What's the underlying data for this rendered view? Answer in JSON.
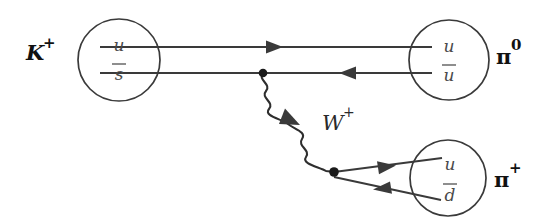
{
  "figure": {
    "type": "feynman-diagram",
    "background_color": "#ffffff",
    "line_color": "#3a3a3a",
    "label_color": "#111111",
    "quark_label_color": "#4a4a4a"
  },
  "initial_state": {
    "name": "kaon-plus",
    "symbol": "K",
    "charge": "+",
    "quarks": [
      {
        "symbol": "u",
        "bar": false
      },
      {
        "symbol": "s",
        "bar": true
      }
    ],
    "blob": {
      "cx": 119,
      "cy": 60,
      "r": 41
    },
    "label_position": {
      "x": 26,
      "y": 54
    }
  },
  "final_states": [
    {
      "name": "pion-zero",
      "symbol": "π",
      "charge": "0",
      "quarks": [
        {
          "symbol": "u",
          "bar": false
        },
        {
          "symbol": "u",
          "bar": true
        }
      ],
      "blob": {
        "cx": 449,
        "cy": 60,
        "r": 40
      },
      "label_position": {
        "x": 496,
        "y": 56
      }
    },
    {
      "name": "pion-plus",
      "symbol": "π",
      "charge": "+",
      "quarks": [
        {
          "symbol": "u",
          "bar": false
        },
        {
          "symbol": "d",
          "bar": true
        }
      ],
      "blob": {
        "cx": 448,
        "cy": 178,
        "r": 38
      },
      "label_position": {
        "x": 494,
        "y": 180
      }
    }
  ],
  "boson": {
    "name": "w-boson",
    "symbol": "W",
    "charge": "+",
    "label_position": {
      "x": 324,
      "y": 123
    },
    "from_vertex": {
      "x": 263,
      "y": 73
    },
    "to_vertex": {
      "x": 334,
      "y": 172
    },
    "arrow_direction": "up-left"
  },
  "vertices": [
    {
      "name": "vertex-upper",
      "x": 263,
      "y": 73
    },
    {
      "name": "vertex-lower",
      "x": 334,
      "y": 172
    }
  ],
  "fermion_lines": [
    {
      "name": "spectator-u-line",
      "from": {
        "x": 100,
        "y": 47
      },
      "to": {
        "x": 430,
        "y": 47
      },
      "arrow_at": {
        "x": 277,
        "y": 47
      },
      "arrow_direction": "right"
    },
    {
      "name": "s-antiquark-line",
      "from": {
        "x": 100,
        "y": 73
      },
      "to": {
        "x": 430,
        "y": 73
      },
      "arrow_at": {
        "x": 348,
        "y": 73
      },
      "arrow_direction": "left"
    },
    {
      "name": "u-quark-out-line",
      "from": {
        "x": 334,
        "y": 172
      },
      "to": {
        "x": 440,
        "y": 159
      },
      "arrow_at": {
        "x": 385,
        "y": 166
      },
      "arrow_direction": "right-up"
    },
    {
      "name": "d-antiquark-out-line",
      "from": {
        "x": 334,
        "y": 176
      },
      "to": {
        "x": 438,
        "y": 199
      },
      "arrow_at": {
        "x": 383,
        "y": 187
      },
      "arrow_direction": "left-up"
    }
  ]
}
